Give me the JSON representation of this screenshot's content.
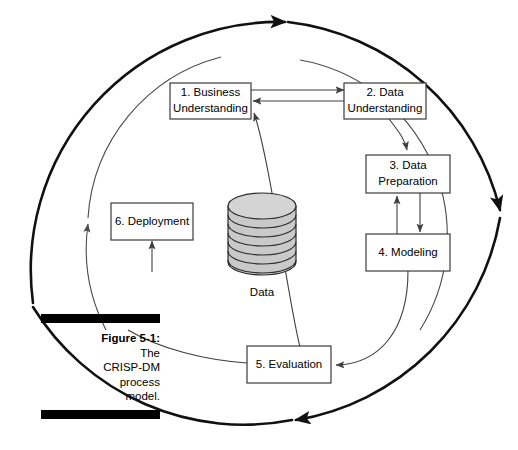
{
  "figure": {
    "caption_label": "Figure 5-1:",
    "caption_lines": [
      "The",
      "CRISP-DM",
      "process",
      "model."
    ],
    "caption_full": "Figure 5-1: The CRISP-DM process model."
  },
  "diagram": {
    "title": "CRISP-DM process model",
    "central_store_label": "Data",
    "nodes": [
      {
        "id": "business-understanding",
        "number": "1.",
        "name": "Business Understanding",
        "line1": "1. Business",
        "line2": "Understanding"
      },
      {
        "id": "data-understanding",
        "number": "2.",
        "name": "Data Understanding",
        "line1": "2. Data",
        "line2": "Understanding"
      },
      {
        "id": "data-preparation",
        "number": "3.",
        "name": "Data Preparation",
        "line1": "3. Data",
        "line2": "Preparation"
      },
      {
        "id": "modeling",
        "number": "4.",
        "name": "Modeling",
        "line1": "4. Modeling",
        "line2": ""
      },
      {
        "id": "evaluation",
        "number": "5.",
        "name": "Evaluation",
        "line1": "5. Evaluation",
        "line2": ""
      },
      {
        "id": "deployment",
        "number": "6.",
        "name": "Deployment",
        "line1": "6. Deployment",
        "line2": ""
      }
    ],
    "connections": [
      {
        "from": "business-understanding",
        "to": "data-understanding",
        "style": "straight"
      },
      {
        "from": "data-understanding",
        "to": "business-understanding",
        "style": "straight"
      },
      {
        "from": "data-understanding",
        "to": "data-preparation",
        "style": "curved"
      },
      {
        "from": "data-preparation",
        "to": "modeling",
        "style": "straight"
      },
      {
        "from": "modeling",
        "to": "data-preparation",
        "style": "straight"
      },
      {
        "from": "modeling",
        "to": "evaluation",
        "style": "curved"
      },
      {
        "from": "evaluation",
        "to": "business-understanding",
        "style": "curved"
      },
      {
        "from": "evaluation",
        "to": "deployment",
        "style": "curved"
      }
    ],
    "outer_cycle": {
      "direction": "clockwise",
      "arrow_count": 3
    },
    "colors": {
      "box_stroke": "#3a3a3a",
      "box_fill": "#ffffff",
      "arrow": "#3f3f3f",
      "outer_ring": "#111111",
      "inner_ring": "#4a4a4a",
      "cylinder_fill": "#c9c9c9",
      "text": "#000000",
      "caption_bar": "#000000"
    }
  }
}
